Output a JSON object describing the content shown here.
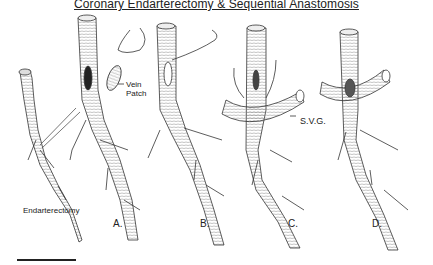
{
  "title": "Coronary Endarterectomy & Sequential Anastomosis",
  "labels": {
    "endarterectomy": "Endarterectomy",
    "vein_patch_line1": "Vein",
    "vein_patch_line2": "Patch",
    "svg": "S.V.G."
  },
  "panels": [
    "A.",
    "B.",
    "C.",
    "D."
  ],
  "colors": {
    "ink": "#222222",
    "background": "#ffffff",
    "shading": "#9a9a9a"
  }
}
